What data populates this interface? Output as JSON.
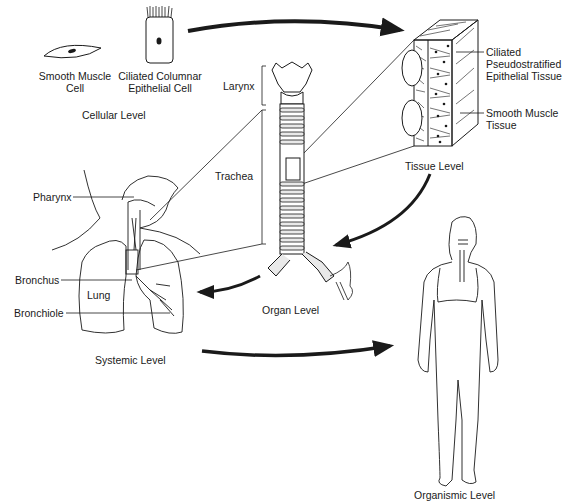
{
  "diagram": {
    "topic": "Levels of organization of the respiratory system",
    "levels": [
      {
        "id": "cellular",
        "label": "Cellular Level"
      },
      {
        "id": "tissue",
        "label": "Tissue Level"
      },
      {
        "id": "organ",
        "label": "Organ Level"
      },
      {
        "id": "systemic",
        "label": "Systemic Level"
      },
      {
        "id": "organismic",
        "label": "Organismic Level"
      }
    ],
    "flow": [
      "cellular",
      "tissue",
      "organ",
      "systemic",
      "organismic"
    ]
  },
  "cellular": {
    "level_label": "Cellular Level",
    "cells": [
      {
        "label_line1": "Smooth Muscle",
        "label_line2": "Cell"
      },
      {
        "label_line1": "Ciliated Columnar",
        "label_line2": "Epithelial Cell"
      }
    ]
  },
  "tissue": {
    "level_label": "Tissue Level",
    "callouts": [
      {
        "line1": "Ciliated",
        "line2": "Pseudostratified",
        "line3": "Epithelial Tissue"
      },
      {
        "line1": "Smooth Muscle",
        "line2": "Tissue"
      }
    ]
  },
  "organ": {
    "level_label": "Organ Level",
    "callouts": [
      {
        "label": "Larynx"
      },
      {
        "label": "Trachea"
      }
    ]
  },
  "systemic": {
    "level_label": "Systemic Level",
    "callouts": [
      {
        "label": "Pharynx"
      },
      {
        "label": "Bronchus"
      },
      {
        "label": "Lung"
      },
      {
        "label": "Bronchiole"
      }
    ]
  },
  "organismic": {
    "level_label": "Organismic Level"
  },
  "colors": {
    "ink": "#1a1a1a",
    "background": "#ffffff"
  }
}
